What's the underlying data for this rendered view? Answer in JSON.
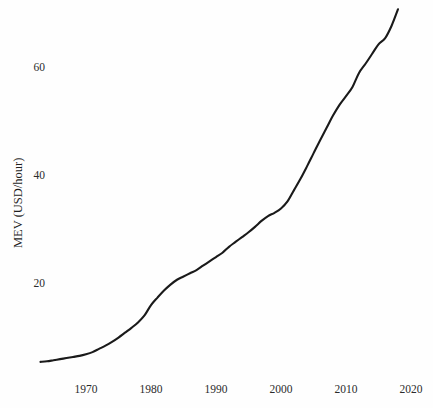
{
  "chart_data": {
    "type": "line",
    "title": "",
    "subtitle": "",
    "xlabel": "",
    "ylabel": "MEV (USD/hour)",
    "xlim": [
      1963,
      2021
    ],
    "ylim": [
      5,
      72
    ],
    "grid": false,
    "legend": null,
    "line_color": "#1a1a1a",
    "background_color": "#fefefe",
    "x_ticks": [
      1970,
      1980,
      1990,
      2000,
      2010,
      2020
    ],
    "x_tick_labels": [
      "1970",
      "1980",
      "1990",
      "2000",
      "2010",
      "2020"
    ],
    "y_ticks": [
      20,
      40,
      60
    ],
    "y_tick_labels": [
      "20",
      "40",
      "60"
    ],
    "series": [
      {
        "name": "MEV",
        "x": [
          1963,
          1964,
          1965,
          1966,
          1967,
          1968,
          1969,
          1970,
          1971,
          1972,
          1973,
          1974,
          1975,
          1976,
          1977,
          1978,
          1979,
          1980,
          1981,
          1982,
          1983,
          1984,
          1985,
          1986,
          1987,
          1988,
          1989,
          1990,
          1991,
          1992,
          1993,
          1994,
          1995,
          1996,
          1997,
          1998,
          1999,
          2000,
          2001,
          2002,
          2003,
          2004,
          2005,
          2006,
          2007,
          2008,
          2009,
          2010,
          2011,
          2012,
          2013,
          2014,
          2015,
          2016,
          2017,
          2018
        ],
        "values": [
          5.4,
          5.5,
          5.7,
          5.9,
          6.1,
          6.3,
          6.5,
          6.8,
          7.2,
          7.8,
          8.4,
          9.1,
          9.9,
          10.8,
          11.7,
          12.7,
          14.0,
          15.9,
          17.3,
          18.6,
          19.7,
          20.6,
          21.2,
          21.8,
          22.4,
          23.2,
          24.0,
          24.8,
          25.6,
          26.7,
          27.6,
          28.5,
          29.4,
          30.4,
          31.5,
          32.4,
          33.0,
          33.8,
          35.1,
          37.2,
          39.3,
          41.6,
          44.0,
          46.4,
          48.7,
          51.0,
          53.0,
          54.6,
          56.3,
          58.9,
          60.6,
          62.4,
          64.2,
          65.3,
          67.6,
          70.7
        ]
      }
    ]
  },
  "axes": {
    "y_axis_title": "MEV (USD/hour)"
  }
}
